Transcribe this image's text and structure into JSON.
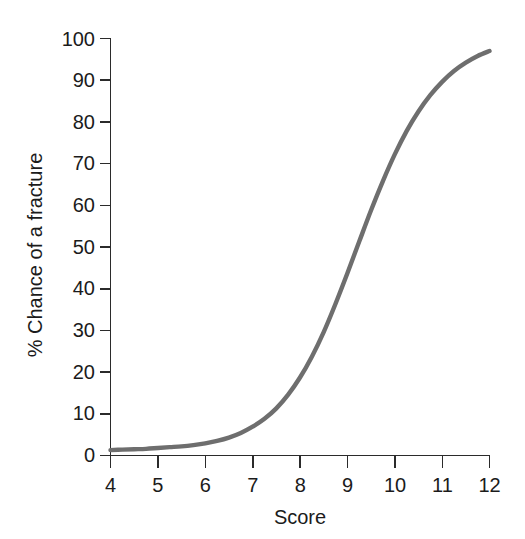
{
  "chart_data": {
    "type": "line",
    "title": "",
    "xlabel": "Score",
    "ylabel": "% Chance of a fracture",
    "xlim": [
      4,
      12
    ],
    "ylim": [
      0,
      100
    ],
    "xticks": [
      4,
      5,
      6,
      7,
      8,
      9,
      10,
      11,
      12
    ],
    "xtick_labels": [
      "4",
      "5",
      "6",
      "7",
      "8",
      "9",
      "10",
      "11",
      "12"
    ],
    "yticks": [
      0,
      10,
      20,
      30,
      40,
      50,
      60,
      70,
      80,
      90,
      100
    ],
    "ytick_labels": [
      "0",
      "10",
      "20",
      "30",
      "40",
      "50",
      "60",
      "70",
      "80",
      "90",
      "100"
    ],
    "grid": false,
    "legend": false,
    "legend_position": "none",
    "series": [
      {
        "name": "Chance of a fracture",
        "color": "#6e6e6e",
        "line_width": 4.4,
        "x": [
          4.0,
          4.25,
          4.5,
          4.75,
          5.0,
          5.25,
          5.5,
          5.75,
          6.0,
          6.25,
          6.5,
          6.75,
          7.0,
          7.25,
          7.5,
          7.75,
          8.0,
          8.25,
          8.5,
          8.75,
          9.0,
          9.25,
          9.5,
          9.75,
          10.0,
          10.25,
          10.5,
          10.75,
          11.0,
          11.25,
          11.5,
          11.75,
          12.0
        ],
        "values": [
          1.3,
          1.4,
          1.5,
          1.6,
          1.8,
          2.0,
          2.2,
          2.5,
          2.9,
          3.5,
          4.3,
          5.4,
          6.9,
          8.8,
          11.3,
          14.6,
          18.7,
          23.7,
          29.6,
          36.4,
          43.7,
          51.3,
          58.8,
          65.8,
          72.2,
          77.8,
          82.5,
          86.4,
          89.6,
          92.2,
          94.2,
          95.8,
          97.0
        ]
      }
    ],
    "annotations": []
  },
  "axes": {
    "y_title": "% Chance of a fracture",
    "x_title": "Score"
  },
  "style": {
    "background": "#ffffff",
    "axis_color": "#2b2b2b",
    "text_color": "#1b1b1b",
    "curve_color": "#6e6e6e"
  }
}
